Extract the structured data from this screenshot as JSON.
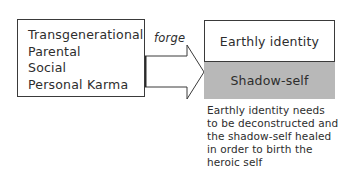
{
  "diagram": {
    "type": "flow",
    "source_box": {
      "lines": [
        "Transgenerational",
        "Parental",
        "Social",
        "Personal Karma"
      ]
    },
    "connector": {
      "label": "forge",
      "shape": "block-arrow-right"
    },
    "target_box": {
      "top_label": "Earthly identity",
      "bottom_label": "Shadow-self"
    },
    "caption": {
      "lines": [
        "Earthly identity needs",
        "to be deconstructed and",
        "the shadow-self healed",
        "in order to birth the",
        "heroic self"
      ]
    }
  },
  "colors": {
    "background": "#ffffff",
    "border": "#3a3a3a",
    "text": "#2d2d2d",
    "shadow_fill": "#b8b8b8"
  }
}
